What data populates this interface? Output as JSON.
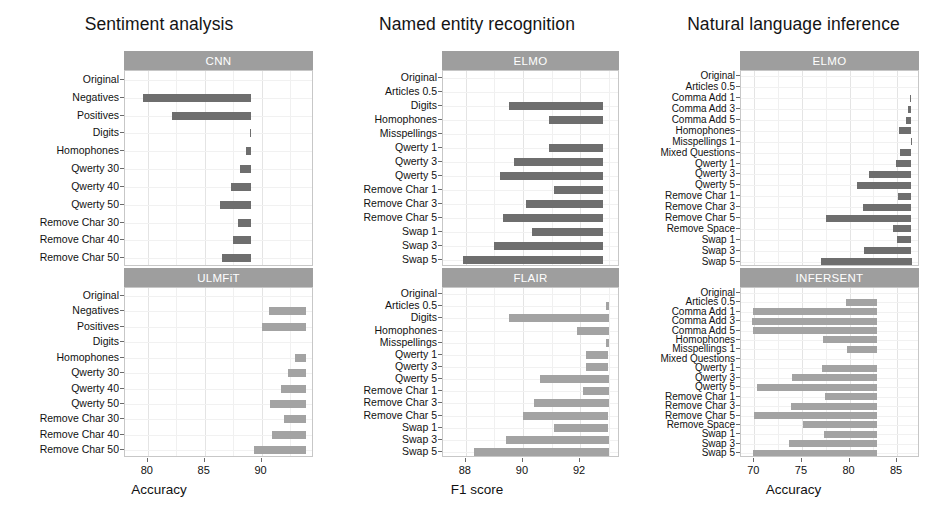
{
  "figure": {
    "columns": [
      {
        "title": "Sentiment analysis",
        "xlabel": "Accuracy",
        "xticks": [
          80,
          85,
          90
        ],
        "xlim": [
          78.0,
          94.6
        ],
        "panels": [
          {
            "strip": "CNN",
            "shade": "dark",
            "categories": [
              "Original",
              "Negatives",
              "Positives",
              "Digits",
              "Homophones",
              "Qwerty 30",
              "Qwerty 40",
              "Qwerty 50",
              "Remove Char 30",
              "Remove Char 40",
              "Remove Char 50"
            ],
            "baseline": 89.1,
            "values": [
              89.1,
              79.6,
              82.1,
              89.0,
              88.6,
              88.1,
              87.3,
              86.3,
              87.9,
              87.5,
              86.5
            ]
          },
          {
            "strip": "ULMFiT",
            "shade": "light",
            "categories": [
              "Original",
              "Negatives",
              "Positives",
              "Digits",
              "Homophones",
              "Qwerty 30",
              "Qwerty 40",
              "Qwerty 50",
              "Remove Char 30",
              "Remove Char 40",
              "Remove Char 50"
            ],
            "baseline": 93.9,
            "values": [
              93.9,
              90.6,
              90.0,
              93.9,
              92.9,
              92.3,
              91.7,
              90.7,
              92.0,
              90.9,
              89.3
            ]
          }
        ]
      },
      {
        "title": "Named entity recognition",
        "xlabel": "F1 score",
        "xticks": [
          88,
          90,
          92
        ],
        "xlim": [
          87.2,
          93.4
        ],
        "panels": [
          {
            "strip": "ELMO",
            "shade": "dark",
            "categories": [
              "Original",
              "Articles 0.5",
              "Digits",
              "Homophones",
              "Misspellings",
              "Qwerty 1",
              "Qwerty 3",
              "Qwerty 5",
              "Remove Char 1",
              "Remove Char 3",
              "Remove Char 5",
              "Swap 1",
              "Swap 3",
              "Swap 5"
            ],
            "baseline": 92.8,
            "values": [
              92.8,
              92.8,
              89.5,
              90.9,
              92.8,
              90.9,
              89.7,
              89.2,
              91.1,
              90.1,
              89.3,
              90.3,
              89.0,
              87.9
            ]
          },
          {
            "strip": "FLAIR",
            "shade": "light",
            "categories": [
              "Original",
              "Articles 0.5",
              "Digits",
              "Homophones",
              "Misspellings",
              "Qwerty 1",
              "Qwerty 3",
              "Qwerty 5",
              "Remove Char 1",
              "Remove Char 3",
              "Remove Char 5",
              "Swap 1",
              "Swap 3",
              "Swap 5"
            ],
            "baseline": 93.0,
            "values": [
              93.0,
              92.9,
              89.5,
              91.9,
              92.9,
              92.2,
              92.2,
              90.6,
              92.1,
              90.4,
              90.0,
              91.1,
              89.4,
              88.3
            ]
          }
        ]
      },
      {
        "title": "Natural language inference",
        "xlabel": "Accuracy",
        "xticks": [
          70,
          75,
          80,
          85
        ],
        "xlim": [
          68.6,
          87.4
        ],
        "panels": [
          {
            "strip": "ELMO",
            "shade": "dark",
            "categories": [
              "Original",
              "Articles 0.5",
              "Comma Add 1",
              "Comma Add 3",
              "Comma Add 5",
              "Homophones",
              "Misspellings 1",
              "Mixed Questions",
              "Qwerty 1",
              "Qwerty 3",
              "Qwerty 5",
              "Remove Char 1",
              "Remove Char 3",
              "Remove Char 5",
              "Remove Space",
              "Swap 1",
              "Swap 3",
              "Swap 5"
            ],
            "baseline": 86.5,
            "values": [
              86.5,
              86.5,
              86.3,
              86.1,
              85.9,
              85.2,
              86.4,
              85.3,
              84.9,
              82.0,
              80.8,
              85.1,
              81.4,
              77.5,
              84.6,
              85.0,
              81.5,
              77.0
            ]
          },
          {
            "strip": "INFERSENT",
            "shade": "light",
            "categories": [
              "Original",
              "Articles 0.5",
              "Comma Add 1",
              "Comma Add 3",
              "Comma Add 5",
              "Homophones",
              "Misspellings 1",
              "Mixed Questions",
              "Qwerty 1",
              "Qwerty 3",
              "Qwerty 5",
              "Remove Char 1",
              "Remove Char 3",
              "Remove Char 5",
              "Remove Space",
              "Swap 1",
              "Swap 3",
              "Swap 5"
            ],
            "baseline": 82.9,
            "values": [
              82.9,
              79.6,
              69.9,
              69.8,
              69.9,
              77.2,
              79.7,
              82.9,
              77.1,
              73.9,
              70.3,
              77.4,
              73.8,
              70.0,
              75.1,
              77.3,
              73.6,
              69.9
            ]
          }
        ]
      }
    ],
    "colors": {
      "bar_dark": "#6e6e6e",
      "bar_light": "#a3a3a3",
      "strip_background": "#9e9e9e",
      "strip_text": "#ffffff",
      "grid": "#e4e4e4",
      "panel_border": "#c7c7c7",
      "text": "#111111"
    }
  },
  "chart_data": [
    {
      "type": "bar",
      "title": "Sentiment analysis - CNN",
      "orientation": "horizontal",
      "xlabel": "Accuracy",
      "ylabel": "",
      "xlim": [
        78.0,
        94.6
      ],
      "xticks": [
        80,
        85,
        90
      ],
      "grid": true,
      "legend": "none",
      "categories": [
        "Original",
        "Negatives",
        "Positives",
        "Digits",
        "Homophones",
        "Qwerty 30",
        "Qwerty 40",
        "Qwerty 50",
        "Remove Char 30",
        "Remove Char 40",
        "Remove Char 50"
      ],
      "values": [
        89.1,
        79.6,
        82.1,
        89.0,
        88.6,
        88.1,
        87.3,
        86.3,
        87.9,
        87.5,
        86.5
      ]
    },
    {
      "type": "bar",
      "title": "Sentiment analysis - ULMFiT",
      "orientation": "horizontal",
      "xlabel": "Accuracy",
      "ylabel": "",
      "xlim": [
        78.0,
        94.6
      ],
      "xticks": [
        80,
        85,
        90
      ],
      "grid": true,
      "legend": "none",
      "categories": [
        "Original",
        "Negatives",
        "Positives",
        "Digits",
        "Homophones",
        "Qwerty 30",
        "Qwerty 40",
        "Qwerty 50",
        "Remove Char 30",
        "Remove Char 40",
        "Remove Char 50"
      ],
      "values": [
        93.9,
        90.6,
        90.0,
        93.9,
        92.9,
        92.3,
        91.7,
        90.7,
        92.0,
        90.9,
        89.3
      ]
    },
    {
      "type": "bar",
      "title": "Named entity recognition - ELMO",
      "orientation": "horizontal",
      "xlabel": "F1 score",
      "ylabel": "",
      "xlim": [
        87.2,
        93.4
      ],
      "xticks": [
        88,
        90,
        92
      ],
      "grid": true,
      "legend": "none",
      "categories": [
        "Original",
        "Articles 0.5",
        "Digits",
        "Homophones",
        "Misspellings",
        "Qwerty 1",
        "Qwerty 3",
        "Qwerty 5",
        "Remove Char 1",
        "Remove Char 3",
        "Remove Char 5",
        "Swap 1",
        "Swap 3",
        "Swap 5"
      ],
      "values": [
        92.8,
        92.8,
        89.5,
        90.9,
        92.8,
        90.9,
        89.7,
        89.2,
        91.1,
        90.1,
        89.3,
        90.3,
        89.0,
        87.9
      ]
    },
    {
      "type": "bar",
      "title": "Named entity recognition - FLAIR",
      "orientation": "horizontal",
      "xlabel": "F1 score",
      "ylabel": "",
      "xlim": [
        87.2,
        93.4
      ],
      "xticks": [
        88,
        90,
        92
      ],
      "grid": true,
      "legend": "none",
      "categories": [
        "Original",
        "Articles 0.5",
        "Digits",
        "Homophones",
        "Misspellings",
        "Qwerty 1",
        "Qwerty 3",
        "Qwerty 5",
        "Remove Char 1",
        "Remove Char 3",
        "Remove Char 5",
        "Swap 1",
        "Swap 3",
        "Swap 5"
      ],
      "values": [
        93.0,
        92.9,
        89.5,
        91.9,
        92.9,
        92.2,
        92.2,
        90.6,
        92.1,
        90.4,
        90.0,
        91.1,
        89.4,
        88.3
      ]
    },
    {
      "type": "bar",
      "title": "Natural language inference - ELMO",
      "orientation": "horizontal",
      "xlabel": "Accuracy",
      "ylabel": "",
      "xlim": [
        68.6,
        87.4
      ],
      "xticks": [
        70,
        75,
        80,
        85
      ],
      "grid": true,
      "legend": "none",
      "categories": [
        "Original",
        "Articles 0.5",
        "Comma Add 1",
        "Comma Add 3",
        "Comma Add 5",
        "Homophones",
        "Misspellings 1",
        "Mixed Questions",
        "Qwerty 1",
        "Qwerty 3",
        "Qwerty 5",
        "Remove Char 1",
        "Remove Char 3",
        "Remove Char 5",
        "Remove Space",
        "Swap 1",
        "Swap 3",
        "Swap 5"
      ],
      "values": [
        86.5,
        86.5,
        86.3,
        86.1,
        85.9,
        85.2,
        86.4,
        85.3,
        84.9,
        82.0,
        80.8,
        85.1,
        81.4,
        77.5,
        84.6,
        85.0,
        81.5,
        77.0
      ]
    },
    {
      "type": "bar",
      "title": "Natural language inference - INFERSENT",
      "orientation": "horizontal",
      "xlabel": "Accuracy",
      "ylabel": "",
      "xlim": [
        68.6,
        87.4
      ],
      "xticks": [
        70,
        75,
        80,
        85
      ],
      "grid": true,
      "legend": "none",
      "categories": [
        "Original",
        "Articles 0.5",
        "Comma Add 1",
        "Comma Add 3",
        "Comma Add 5",
        "Homophones",
        "Misspellings 1",
        "Mixed Questions",
        "Qwerty 1",
        "Qwerty 3",
        "Qwerty 5",
        "Remove Char 1",
        "Remove Char 3",
        "Remove Char 5",
        "Remove Space",
        "Swap 1",
        "Swap 3",
        "Swap 5"
      ],
      "values": [
        82.9,
        79.6,
        69.9,
        69.8,
        69.9,
        77.2,
        79.7,
        82.9,
        77.1,
        73.9,
        70.3,
        77.4,
        73.8,
        70.0,
        75.1,
        77.3,
        73.6,
        69.9
      ]
    }
  ]
}
